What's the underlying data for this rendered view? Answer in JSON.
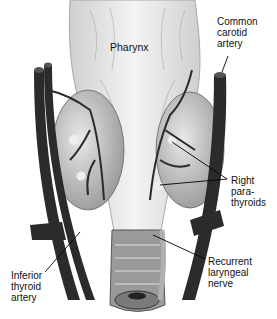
{
  "figure": {
    "colors": {
      "background": "#ffffff",
      "pharynx": "#e2e2e2",
      "gland": "#bdbdbd",
      "vessel": "#2b2b2b",
      "trachea": "#8c8c8c",
      "nerve": "#a8a8a8",
      "leader": "#000000"
    }
  },
  "labels": {
    "pharynx": [
      "Pharynx"
    ],
    "common_carotid_artery": [
      "Common",
      "carotid",
      "artery"
    ],
    "right_parathyroids": [
      "Right",
      "para-",
      "thyroids"
    ],
    "recurrent_laryngeal_nerve": [
      "Recurrent",
      "laryngeal",
      "nerve"
    ],
    "inferior_thyroid_artery": [
      "Inferior",
      "thyroid",
      "artery"
    ]
  }
}
